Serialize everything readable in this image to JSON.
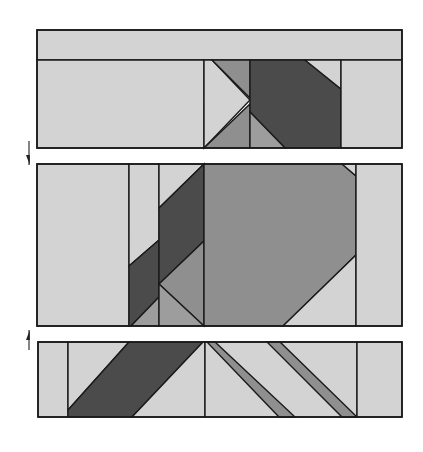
{
  "diagram": {
    "title": "Quilt block assembly: three rows joined",
    "colors": {
      "light": "#d3d3d3",
      "medium": "#8f8f8f",
      "medium_light": "#9d9d9d",
      "dark": "#4b4b4b",
      "line": "#1a1a1a"
    },
    "rows": [
      {
        "name": "top-row",
        "bbox": [
          37,
          30,
          402,
          148
        ],
        "pieces": [
          {
            "name": "top-border-strip",
            "fill": "light",
            "points": "37,30 402,30 402,60 37,60"
          },
          {
            "name": "left-rectangle",
            "fill": "light",
            "points": "37,60 204,60 204,148 37,148"
          },
          {
            "name": "light-triangle-center",
            "fill": "light",
            "points": "204,60 212,60 250,100 204,148"
          },
          {
            "name": "medium-triangle-top",
            "fill": "medium",
            "points": "212,60 250,60 250,98"
          },
          {
            "name": "medium-triangle-bottom",
            "fill": "medium",
            "points": "204,148 250,104 250,148"
          },
          {
            "name": "dark-diagonal-band",
            "fill": "dark",
            "points": "250,60 305,60 341,89 341,148 285,148 250,112"
          },
          {
            "name": "light-corner-triangle",
            "fill": "light",
            "points": "305,60 341,60 341,89"
          },
          {
            "name": "medium-corner-triangle",
            "fill": "medium_light",
            "points": "250,112 285,148 250,148"
          },
          {
            "name": "right-rectangle",
            "fill": "light",
            "points": "341,60 402,60 402,148 341,148"
          }
        ]
      },
      {
        "name": "middle-row",
        "bbox": [
          37,
          164,
          402,
          326
        ],
        "pieces": [
          {
            "name": "left-rectangle",
            "fill": "light",
            "points": "37,164 129,164 129,326 37,326"
          },
          {
            "name": "narrow-strip-light",
            "fill": "light",
            "points": "129,164 159,164 159,240 129,266"
          },
          {
            "name": "narrow-strip-dark",
            "fill": "dark",
            "points": "129,266 159,240 159,297 131,326 129,326"
          },
          {
            "name": "narrow-strip-medium",
            "fill": "medium_light",
            "points": "131,326 159,297 159,326"
          },
          {
            "name": "light-triangle-top",
            "fill": "light",
            "points": "159,164 204,164 159,208"
          },
          {
            "name": "dark-diagonal-band",
            "fill": "dark",
            "points": "159,208 204,164 204,241 159,284"
          },
          {
            "name": "medium-triangle-right",
            "fill": "medium",
            "points": "159,284 204,241 204,326"
          },
          {
            "name": "medium-triangle-left",
            "fill": "medium_light",
            "points": "159,284 204,326 159,326"
          },
          {
            "name": "large-octagon",
            "fill": "medium",
            "points": "204,164 342,164 356,176 356,255 283,326 204,326"
          },
          {
            "name": "light-corner-top",
            "fill": "light",
            "points": "342,164 356,164 356,176"
          },
          {
            "name": "light-corner-bottom",
            "fill": "light",
            "points": "356,255 356,326 283,326"
          },
          {
            "name": "right-rectangle",
            "fill": "light",
            "points": "356,164 402,164 402,326 356,326"
          }
        ]
      },
      {
        "name": "bottom-row",
        "bbox": [
          38,
          342,
          402,
          417
        ],
        "pieces": [
          {
            "name": "left-rectangle",
            "fill": "light",
            "points": "38,342 68,342 68,417 38,417"
          },
          {
            "name": "light-triangle-upper",
            "fill": "light",
            "points": "68,342 129,342 68,410"
          },
          {
            "name": "dark-diagonal-band",
            "fill": "dark",
            "points": "129,342 203,342 132,417 68,417 68,410"
          },
          {
            "name": "light-triangle-lower",
            "fill": "light",
            "points": "203,342 205,342 205,417 132,417"
          },
          {
            "name": "light-center-square",
            "fill": "light",
            "points": "205,342 357,342 357,417 205,417"
          },
          {
            "name": "medium-stripe-1",
            "fill": "medium",
            "points": "207,342 215,342 295,417 279,417"
          },
          {
            "name": "medium-stripe-2",
            "fill": "medium",
            "points": "267,342 280,342 357,417 342,417"
          },
          {
            "name": "right-rectangle",
            "fill": "light",
            "points": "357,342 402,342 402,417 357,417"
          }
        ]
      }
    ],
    "arrows": [
      {
        "name": "down-arrow",
        "direction": "down",
        "x": 29,
        "y1": 141,
        "y2": 165
      },
      {
        "name": "up-arrow",
        "direction": "up",
        "x": 29,
        "y1": 330,
        "y2": 350
      }
    ]
  }
}
